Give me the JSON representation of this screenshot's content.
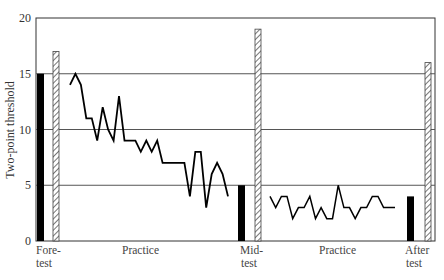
{
  "chart_data": {
    "type": "line",
    "title": "",
    "xlabel": "",
    "ylabel": "Two-point threshold",
    "ylim": [
      0,
      20
    ],
    "yticks": [
      0,
      5,
      10,
      15,
      20
    ],
    "grid": {
      "horizontal": true,
      "lines_at": [
        5,
        10,
        15
      ]
    },
    "legend": null,
    "phase_labels": [
      {
        "text": [
          "Fore-",
          "test"
        ],
        "x_px": 36
      },
      {
        "text": [
          "Practice"
        ],
        "x_px": 140
      },
      {
        "text": [
          "Mid-",
          "test"
        ],
        "x_px": 240
      },
      {
        "text": [
          "Practice"
        ],
        "x_px": 322
      },
      {
        "text": [
          "After",
          "test"
        ],
        "x_px": 417
      }
    ],
    "test_bars": [
      {
        "phase": "Fore-test",
        "solid": 15,
        "hatched": 17
      },
      {
        "phase": "Mid-test",
        "solid": 5,
        "hatched": 19
      },
      {
        "phase": "After test",
        "solid": 4,
        "hatched": 16
      }
    ],
    "series": [
      {
        "name": "Practice 1",
        "values": [
          14,
          15,
          14,
          11,
          11,
          9,
          12,
          10,
          9,
          13,
          9,
          9,
          9,
          8,
          9,
          8,
          9,
          7,
          7,
          7,
          7,
          7,
          4,
          8,
          8,
          3,
          6,
          7,
          6,
          4
        ]
      },
      {
        "name": "Practice 2",
        "values": [
          4,
          3,
          4,
          4,
          2,
          3,
          3,
          4,
          2,
          3,
          2,
          2,
          5,
          3,
          3,
          2,
          3,
          3,
          4,
          4,
          3,
          3,
          3
        ]
      }
    ]
  },
  "axis": {
    "y_title": "Two-point threshold",
    "ticks": [
      "0",
      "5",
      "10",
      "15",
      "20"
    ]
  },
  "labels": {
    "fore_1": "Fore-",
    "fore_2": "test",
    "practice_1": "Practice",
    "mid_1": "Mid-",
    "mid_2": "test",
    "practice_2": "Practice",
    "after_1": "After",
    "after_2": "test"
  },
  "colors": {
    "axis": "#333333",
    "grid": "#555555",
    "line": "#000000",
    "solid_bar": "#000000",
    "hatch": "#555555"
  }
}
